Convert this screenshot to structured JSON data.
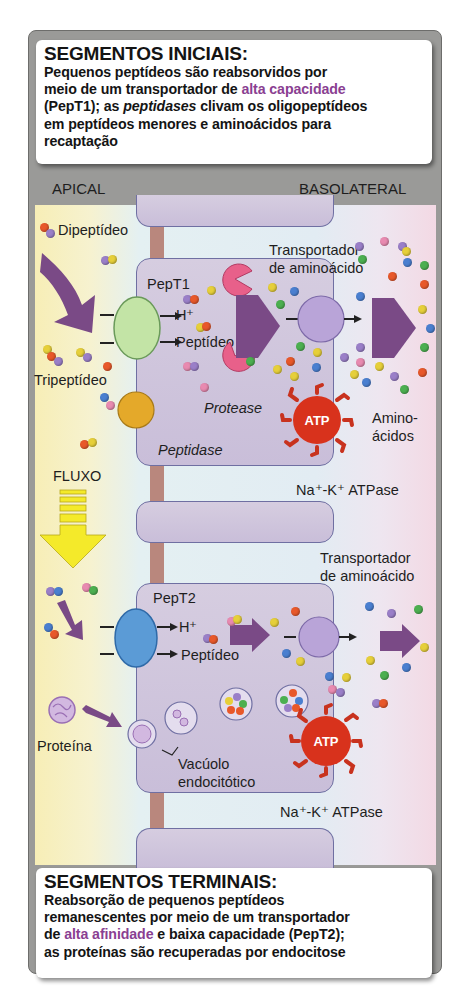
{
  "top_box": {
    "title": "SEGMENTOS INICIAIS:",
    "line1": "Pequenos peptídeos são reabsorvidos por",
    "line2_pre": "meio de um transportador de ",
    "line2_highlight": "alta capacidade",
    "line3_pre": "(PepT1); as ",
    "line3_italic": "peptidases",
    "line3_post": " clivam os oligopeptídeos",
    "line4": "em peptídeos menores e aminoácidos para",
    "line5": "recaptação"
  },
  "sides": {
    "left": "APICAL",
    "right": "BASOLATERAL"
  },
  "upper_cell": {
    "dipeptide_label": "Dipeptídeo",
    "tripeptide_label": "Tripeptídeo",
    "transporter_label": "PepT1",
    "h_label": "H⁺",
    "peptide_label": "Peptídeo",
    "protease_label": "Protease",
    "peptidase_label": "Peptidase",
    "aa_transporter_line1": "Transportador",
    "aa_transporter_line2": "de aminoácido",
    "aminoacids_line1": "Amino-",
    "aminoacids_line2": "ácidos",
    "atp_text": "ATP",
    "atpase_label": "Na⁺-K⁺ ATPase"
  },
  "flow": {
    "label": "FLUXO"
  },
  "lower_cell": {
    "transporter_label": "PepT2",
    "h_label": "H⁺",
    "peptide_label": "Peptídeo",
    "protein_label": "Proteína",
    "vacuole_line1": "Vacúolo",
    "vacuole_line2": "endocitótico",
    "aa_transporter_line1": "Transportador",
    "aa_transporter_line2": "de aminoácido",
    "atp_text": "ATP",
    "atpase_label": "Na⁺-K⁺ ATPase"
  },
  "bottom_box": {
    "title": "SEGMENTOS TERMINAIS:",
    "line1": "Reabsorção de pequenos peptídeos",
    "line2": "remanescentes por meio de um transportador",
    "line3_pre": "de ",
    "line3_highlight": "alta afinidade",
    "line3_post": " e baixa capacidade (PepT2);",
    "line4": "as proteínas são recuperadas por endocitose"
  },
  "colors": {
    "highlight": "#8a3f92",
    "cell": "#cfc5dd",
    "pept1": "#c3e4a6",
    "pept2": "#5b9bd6",
    "peptidase": "#e4a92a",
    "protease": "#e8608a",
    "atpase": "#d8321c",
    "aa_transporter": "#b9a4d8",
    "arrow": "#7a4a86",
    "flow_arrow": "#f4ea2a"
  }
}
